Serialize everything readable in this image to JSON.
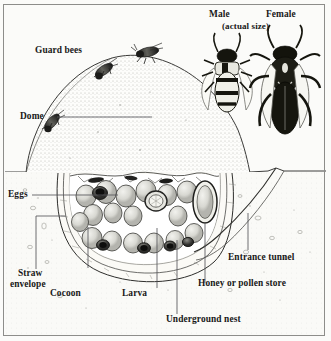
{
  "figure": {
    "type": "scientific-illustration",
    "style": "black and white stippled engraving"
  },
  "labels": {
    "guard_bees": "Guard bees",
    "dome": "Dome",
    "eggs": "Eggs",
    "straw_envelope_line1": "Straw",
    "straw_envelope_line2": "envelope",
    "cocoon": "Cocoon",
    "larva": "Larva",
    "underground_nest": "Underground nest",
    "honey_or_pollen_store": "Honey or pollen store",
    "entrance_tunnel": "Entrance tunnel",
    "male": "Male",
    "female": "Female",
    "actual_size": "(actual size)"
  },
  "colors": {
    "ink": "#181818",
    "leader": "#55555a",
    "paper": "#fbfbf9",
    "stipple": "#b9b9b4",
    "soil": "#f4f3ef",
    "border": "#8d8d8a"
  }
}
